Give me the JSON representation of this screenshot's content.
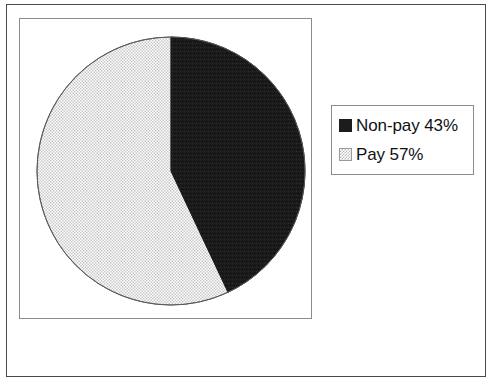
{
  "chart_data": {
    "type": "pie",
    "title": "",
    "categories": [
      "Non-pay",
      "Pay"
    ],
    "values": [
      43,
      57
    ],
    "labels": [
      "Non-pay 43%",
      "Pay 57%"
    ],
    "units": "percent",
    "start_angle_deg": 0,
    "direction": "clockwise",
    "legend_position": "right",
    "grid": false,
    "slices": [
      {
        "name": "Non-pay",
        "value": 43,
        "label": "Non-pay 43%",
        "percent_text": "43%",
        "fill": "solid-black",
        "color": "#1c1c1c",
        "start_deg": 0,
        "sweep_deg": 154.8
      },
      {
        "name": "Pay",
        "value": 57,
        "label": "Pay 57%",
        "percent_text": "57%",
        "fill": "light-stipple",
        "color": "#e8e8e8",
        "start_deg": 154.8,
        "sweep_deg": 205.2
      }
    ]
  },
  "legend": {
    "items": [
      {
        "label": "Non-pay 43%",
        "swatch": "solid-black-swatch"
      },
      {
        "label": "Pay 57%",
        "swatch": "stipple-swatch"
      }
    ]
  }
}
